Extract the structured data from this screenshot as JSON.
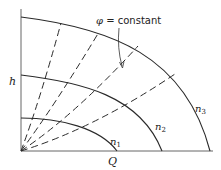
{
  "diagram": {
    "axes": {
      "x_label": "Q",
      "y_label": "h"
    },
    "annotation": {
      "symbol": "φ",
      "text": " = constant"
    },
    "curves": [
      {
        "id": "n1",
        "label_main": "n",
        "label_sub": "1"
      },
      {
        "id": "n2",
        "label_main": "n",
        "label_sub": "2"
      },
      {
        "id": "n3",
        "label_main": "n",
        "label_sub": "3"
      }
    ],
    "dashed_lines_count": 4,
    "colors": {
      "line": "#2a2a2a",
      "axis": "#555555",
      "background": "#ffffff"
    }
  }
}
